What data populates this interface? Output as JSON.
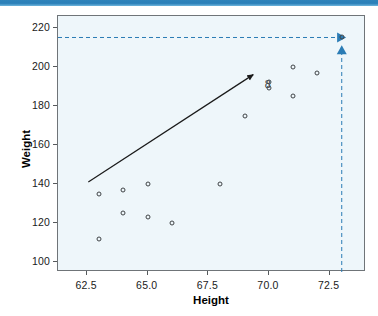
{
  "top_bar": {
    "color": "#2a7fb8"
  },
  "chart_data": {
    "type": "scatter",
    "title": "",
    "xlabel": "Height",
    "ylabel": "Weight",
    "xlim": [
      61.3,
      74.0
    ],
    "ylim": [
      95,
      226
    ],
    "xticks": [
      62.5,
      65.0,
      67.5,
      70.0,
      72.5
    ],
    "xtick_labels": [
      "62.5",
      "65.0",
      "67.5",
      "70.0",
      "72.5"
    ],
    "yticks": [
      100,
      120,
      140,
      160,
      180,
      200,
      220
    ],
    "ytick_labels": [
      "100",
      "120",
      "140",
      "160",
      "180",
      "200",
      "220"
    ],
    "grid": false,
    "legend": null,
    "points": [
      {
        "x": 63.0,
        "y": 135
      },
      {
        "x": 63.0,
        "y": 112
      },
      {
        "x": 64.0,
        "y": 137
      },
      {
        "x": 64.0,
        "y": 125
      },
      {
        "x": 65.0,
        "y": 140
      },
      {
        "x": 65.0,
        "y": 123
      },
      {
        "x": 66.0,
        "y": 120
      },
      {
        "x": 68.0,
        "y": 140
      },
      {
        "x": 69.0,
        "y": 175
      },
      {
        "x": 70.0,
        "y": 192
      },
      {
        "x": 70.0,
        "y": 189
      },
      {
        "x": 71.0,
        "y": 200
      },
      {
        "x": 71.0,
        "y": 185
      },
      {
        "x": 72.0,
        "y": 197
      },
      {
        "x": 73.0,
        "y": 215
      }
    ],
    "annotations": [
      {
        "name": "trend-arrow",
        "type": "arrow",
        "color": "#1a1a1a",
        "x_start": 62.55,
        "y_start": 141,
        "x_end": 69.35,
        "y_end": 196
      },
      {
        "name": "eight-label",
        "type": "text",
        "text": "8",
        "color": "#3a3e41",
        "x": 69.95,
        "y": 191
      },
      {
        "name": "horizontal-guide",
        "type": "dashed-line-with-arrow",
        "color": "#2b7cb5",
        "x_start": 61.3,
        "x_end": 72.85,
        "y": 215
      },
      {
        "name": "vertical-guide",
        "type": "dashed-line-with-arrow",
        "color": "#2b7cb5",
        "x": 73.0,
        "y_start": 95,
        "y_end": 210
      }
    ]
  }
}
